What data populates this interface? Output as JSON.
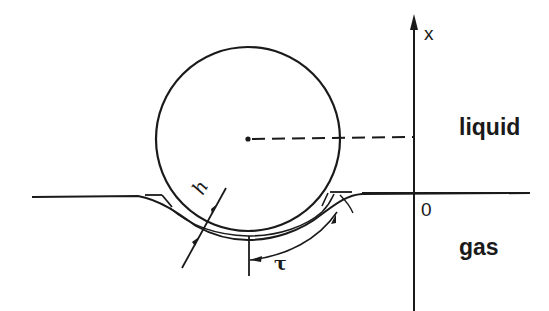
{
  "figure": {
    "type": "schematic",
    "stroke_color": "#1a1a1a",
    "background": "#ffffff"
  },
  "labels": {
    "axis_x": "x",
    "origin": "0",
    "upper_region": "liquid",
    "lower_region": "gas",
    "film_thickness": "h",
    "arc_coordinate": "τ"
  },
  "elements": {
    "sphere": {
      "cx": 248,
      "cy": 138,
      "r": 92
    },
    "vertical_axis": {
      "x": 413,
      "y_top": 20,
      "y_bottom": 312
    },
    "interface_line": {
      "y": 184
    },
    "center_dashed_line": {
      "from": [
        248,
        138
      ],
      "to": [
        413,
        137
      ]
    }
  }
}
